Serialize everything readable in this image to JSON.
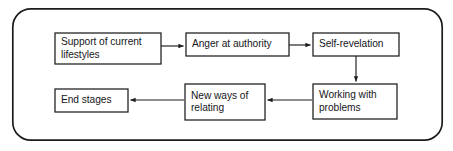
{
  "diagram": {
    "type": "flowchart",
    "background_color": "#ffffff",
    "stroke_color": "#1c1c1e",
    "text_color": "#17171a",
    "frame": {
      "name": "outer-rounded-frame",
      "x": 12,
      "y": 8,
      "width": 431,
      "height": 133,
      "corner_radius": 18,
      "stroke_width": 1.6
    },
    "nodes": [
      {
        "id": "support-of-current-lifestyles",
        "label": "Support of current\nlifestyles",
        "x": 55,
        "y": 33,
        "width": 106,
        "height": 31
      },
      {
        "id": "anger-at-authority",
        "label": "Anger at authority",
        "x": 186,
        "y": 33,
        "width": 103,
        "height": 23
      },
      {
        "id": "self-revelation",
        "label": "Self-revelation",
        "x": 313,
        "y": 33,
        "width": 86,
        "height": 23
      },
      {
        "id": "working-with-problems",
        "label": "Working with\nproblems",
        "x": 313,
        "y": 84,
        "width": 84,
        "height": 35
      },
      {
        "id": "new-ways-of-relating",
        "label": "New ways of\nrelating",
        "x": 185,
        "y": 84,
        "width": 80,
        "height": 36
      },
      {
        "id": "end-stages",
        "label": "End stages",
        "x": 55,
        "y": 89,
        "width": 73,
        "height": 23
      }
    ],
    "connectors": [
      {
        "id": "support-to-anger",
        "from": "support-of-current-lifestyles",
        "to": "anger-at-authority",
        "direction": "right",
        "x1": 161,
        "y1": 46,
        "x2": 184,
        "y2": 46
      },
      {
        "id": "anger-to-self-revelation",
        "from": "anger-at-authority",
        "to": "self-revelation",
        "direction": "right",
        "x1": 289,
        "y1": 45,
        "x2": 311,
        "y2": 45
      },
      {
        "id": "self-revelation-to-working",
        "from": "self-revelation",
        "to": "working-with-problems",
        "direction": "down",
        "x1": 356,
        "y1": 56,
        "x2": 356,
        "y2": 82
      },
      {
        "id": "working-to-new-ways",
        "from": "working-with-problems",
        "to": "new-ways-of-relating",
        "direction": "left",
        "x1": 312,
        "y1": 100,
        "x2": 267,
        "y2": 100
      },
      {
        "id": "new-ways-to-end-stages",
        "from": "new-ways-of-relating",
        "to": "end-stages",
        "direction": "left",
        "x1": 184,
        "y1": 100,
        "x2": 130,
        "y2": 100
      }
    ]
  }
}
